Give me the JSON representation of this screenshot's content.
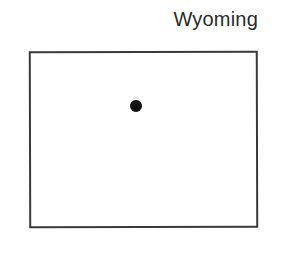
{
  "map": {
    "title": "Wyoming",
    "outline_color": "#3a3a3a",
    "marker": {
      "icon": "dot-marker",
      "color": "#111111"
    }
  }
}
